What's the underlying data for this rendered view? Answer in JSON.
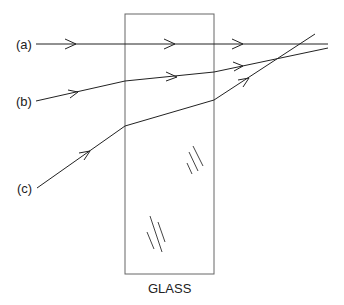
{
  "diagram": {
    "labels": {
      "a": "(a)",
      "b": "(b)",
      "c": "(c)",
      "glass": "GLASS"
    },
    "colors": {
      "line": "#222222",
      "box": "#555555",
      "background": "#ffffff"
    }
  }
}
